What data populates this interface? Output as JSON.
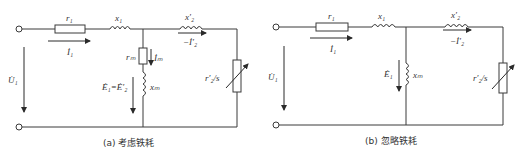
{
  "panels": [
    {
      "id": "a",
      "caption": "(a)  考虑铁耗",
      "labels": {
        "r1": "r₁",
        "x1": "x₁",
        "x2p": "x′₂",
        "I1": "İ₁",
        "minus_I2p": "−İ′₂",
        "U1": "U̇₁",
        "rm": "rₘ",
        "Im": "İₘ",
        "xm": "xₘ",
        "E1": "Ė₁=Ė′₂",
        "r2s": "r′₂/s"
      }
    },
    {
      "id": "b",
      "caption": "(b)  忽略铁耗",
      "labels": {
        "r1": "r₁",
        "x1": "x₁",
        "x2p": "x′₂",
        "I1": "İ₁",
        "minus_I2p": "−İ′₂",
        "U1": "U̇₁",
        "E1": "Ė₁",
        "xm": "xₘ",
        "r2s": "r′₂/s"
      }
    }
  ],
  "colors": {
    "line": "#3a3a3a",
    "text": "#333333",
    "background": "#ffffff"
  }
}
